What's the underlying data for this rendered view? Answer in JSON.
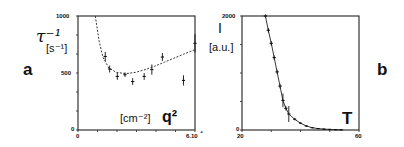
{
  "panels": {
    "a": {
      "letter": "a"
    },
    "b": {
      "letter": "b"
    }
  },
  "chart_data": [
    {
      "id": "a",
      "type": "scatter",
      "title": "",
      "panel_label": "a",
      "xlabel": "q²",
      "xunit": "[cm⁻²]",
      "ylabel": "τ⁻¹",
      "yunit": "[s⁻¹]",
      "xlim": [
        0,
        6.1
      ],
      "ylim": [
        0,
        1000
      ],
      "x_ticks": [
        "0",
        "6.10"
      ],
      "y_ticks": [
        "0",
        "500",
        "1000"
      ],
      "x_tick_suffix": "⁴",
      "grid": false,
      "series": [
        {
          "name": "measured",
          "style": "points with error bars",
          "x": [
            1.42,
            1.65,
            2.05,
            2.45,
            2.85,
            3.45,
            3.85,
            4.4,
            5.5,
            6.1
          ],
          "y": [
            645,
            535,
            470,
            485,
            425,
            470,
            530,
            640,
            435,
            760
          ],
          "yerr": [
            40,
            30,
            30,
            20,
            30,
            30,
            45,
            35,
            45,
            80
          ]
        },
        {
          "name": "fit",
          "style": "dashed curve",
          "x": [
            0.9,
            1.1,
            1.3,
            1.6,
            2.0,
            2.5,
            3.0,
            3.5,
            4.0,
            4.5,
            5.0,
            5.5,
            6.1
          ],
          "y": [
            1000,
            780,
            640,
            545,
            505,
            495,
            505,
            530,
            560,
            595,
            630,
            665,
            705
          ]
        }
      ]
    },
    {
      "id": "b",
      "type": "line",
      "title": "",
      "panel_label": "b",
      "xlabel": "T",
      "ylabel": "I",
      "yunit": "[a.u.]",
      "xlim": [
        20,
        60
      ],
      "ylim": [
        0,
        2000
      ],
      "x_ticks": [
        "20",
        "60"
      ],
      "y_ticks": [
        "0",
        "2000"
      ],
      "grid": false,
      "series": [
        {
          "name": "intensity",
          "style": "line with points and error bars",
          "x": [
            28,
            29,
            30,
            31,
            32,
            33,
            34,
            35,
            36,
            38,
            40,
            42,
            44,
            46,
            48,
            50,
            52,
            54
          ],
          "y": [
            2000,
            1750,
            1520,
            1270,
            1020,
            770,
            520,
            380,
            280,
            190,
            120,
            70,
            40,
            25,
            15,
            10,
            6,
            3
          ],
          "yerr": [
            30,
            40,
            40,
            40,
            40,
            40,
            120,
            40,
            140,
            20,
            15,
            15,
            10,
            10,
            10,
            10,
            8,
            8
          ]
        }
      ]
    }
  ]
}
